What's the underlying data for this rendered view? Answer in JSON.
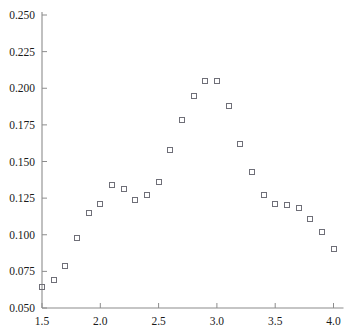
{
  "chart_data": {
    "type": "scatter",
    "title": "",
    "xlabel": "",
    "ylabel": "",
    "xlim": [
      1.45,
      4.05
    ],
    "ylim": [
      0.05,
      0.25
    ],
    "grid": false,
    "legend": null,
    "marker": "open-square",
    "marker_color": "#6f6f78",
    "axis_color": "#8c8c8c",
    "text_color": "#1a1a1a",
    "background_color": "#ffffff",
    "xticks": [
      1.5,
      2.0,
      2.5,
      3.0,
      3.5,
      4.0
    ],
    "xtick_labels": [
      "1.5",
      "2.0",
      "2.5",
      "3.0",
      "3.5",
      "4.0"
    ],
    "yticks": [
      0.05,
      0.075,
      0.1,
      0.125,
      0.15,
      0.175,
      0.2,
      0.225,
      0.25
    ],
    "ytick_labels": [
      "0.050",
      "0.075",
      "0.100",
      "0.125",
      "0.150",
      "0.175",
      "0.200",
      "0.225",
      "0.250"
    ],
    "x": [
      1.5,
      1.6,
      1.7,
      1.8,
      1.9,
      2.0,
      2.1,
      2.2,
      2.3,
      2.4,
      2.5,
      2.6,
      2.7,
      2.8,
      2.9,
      3.0,
      3.1,
      3.2,
      3.3,
      3.4,
      3.5,
      3.6,
      3.7,
      3.8,
      3.9,
      4.0
    ],
    "y": [
      0.064,
      0.069,
      0.079,
      0.098,
      0.115,
      0.121,
      0.134,
      0.131,
      0.124,
      0.127,
      0.136,
      0.158,
      0.178,
      0.195,
      0.205,
      0.205,
      0.188,
      0.162,
      0.143,
      0.127,
      0.121,
      0.12,
      0.118,
      0.111,
      0.102,
      0.09
    ],
    "points": [
      {
        "x": 1.5,
        "y": 0.064
      },
      {
        "x": 1.6,
        "y": 0.069
      },
      {
        "x": 1.7,
        "y": 0.079
      },
      {
        "x": 1.8,
        "y": 0.098
      },
      {
        "x": 1.9,
        "y": 0.115
      },
      {
        "x": 2.0,
        "y": 0.121
      },
      {
        "x": 2.1,
        "y": 0.134
      },
      {
        "x": 2.2,
        "y": 0.131
      },
      {
        "x": 2.3,
        "y": 0.124
      },
      {
        "x": 2.4,
        "y": 0.127
      },
      {
        "x": 2.5,
        "y": 0.136
      },
      {
        "x": 2.6,
        "y": 0.158
      },
      {
        "x": 2.7,
        "y": 0.178
      },
      {
        "x": 2.8,
        "y": 0.195
      },
      {
        "x": 2.9,
        "y": 0.205
      },
      {
        "x": 3.0,
        "y": 0.205
      },
      {
        "x": 3.1,
        "y": 0.188
      },
      {
        "x": 3.2,
        "y": 0.162
      },
      {
        "x": 3.3,
        "y": 0.143
      },
      {
        "x": 3.4,
        "y": 0.127
      },
      {
        "x": 3.5,
        "y": 0.121
      },
      {
        "x": 3.6,
        "y": 0.12
      },
      {
        "x": 3.7,
        "y": 0.118
      },
      {
        "x": 3.8,
        "y": 0.111
      },
      {
        "x": 3.9,
        "y": 0.102
      },
      {
        "x": 4.0,
        "y": 0.09
      }
    ]
  }
}
